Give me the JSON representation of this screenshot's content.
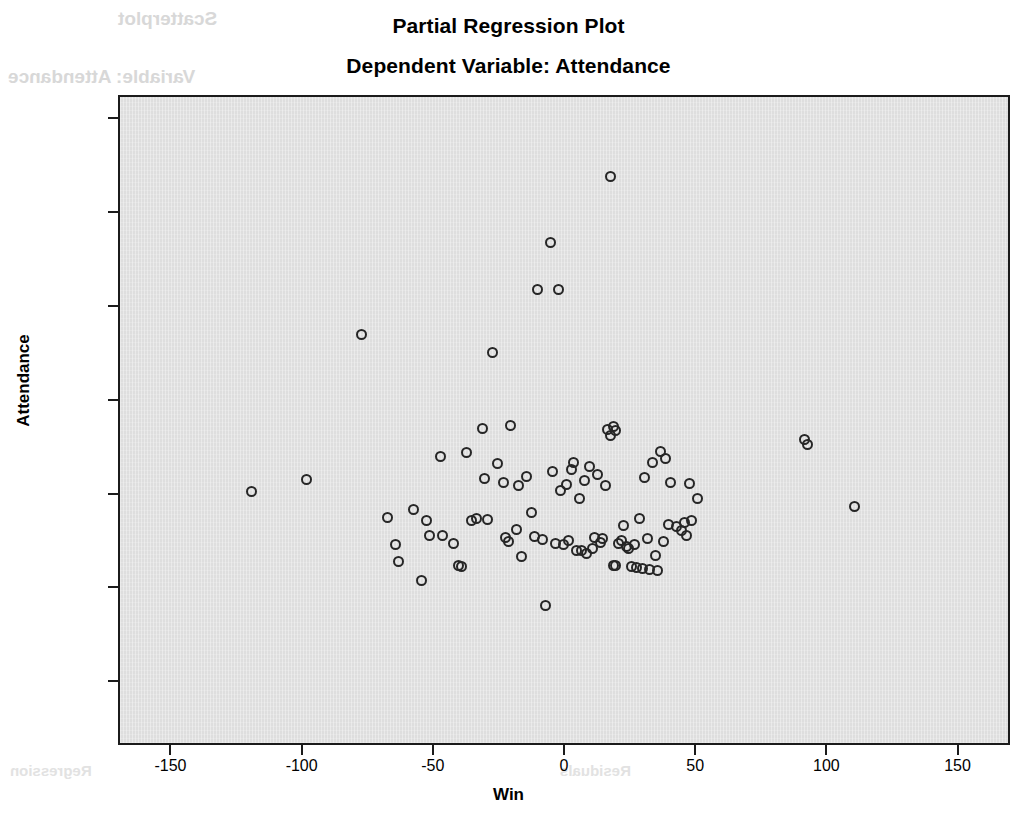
{
  "chart_data": {
    "type": "scatter",
    "title": "Partial Regression Plot",
    "subtitle": "Dependent Variable: Attendance",
    "xlabel": "Win",
    "ylabel": "Attendance",
    "xlim": [
      -170,
      170
    ],
    "ylim": [
      -26800,
      42500
    ],
    "xticks": [
      -150,
      -100,
      -50,
      0,
      50,
      100,
      150
    ],
    "xtick_labels": [
      "-150",
      "-100",
      "-50",
      "0",
      "50",
      "100",
      "150"
    ],
    "yticks": [
      40000,
      30000,
      20000,
      10000,
      0,
      -10000,
      -20000
    ],
    "ytick_labels": [
      "40000",
      "30000",
      "20000",
      "10000",
      "0",
      "-10000",
      "-20000"
    ],
    "grid": false,
    "legend": false,
    "marker": "open-circle",
    "marker_color": "#262626",
    "plot_background": "#dedede",
    "n_points": 95,
    "points": [
      [
        -120,
        400
      ],
      [
        -99,
        1700
      ],
      [
        -78,
        17200
      ],
      [
        -68,
        -2300
      ],
      [
        -65,
        -5200
      ],
      [
        -64,
        -7000
      ],
      [
        -58,
        -1500
      ],
      [
        -55,
        -9000
      ],
      [
        -53,
        -2600
      ],
      [
        -52,
        -4300
      ],
      [
        -48,
        4200
      ],
      [
        -47,
        -4200
      ],
      [
        -43,
        -5100
      ],
      [
        -41,
        -7400
      ],
      [
        -40,
        -7600
      ],
      [
        -38,
        4600
      ],
      [
        -36,
        -2600
      ],
      [
        -34,
        -2400
      ],
      [
        -32,
        7200
      ],
      [
        -31,
        1800
      ],
      [
        -30,
        -2500
      ],
      [
        -28,
        15300
      ],
      [
        -26,
        3400
      ],
      [
        -24,
        1400
      ],
      [
        -23,
        -4500
      ],
      [
        -22,
        -4900
      ],
      [
        -21,
        7500
      ],
      [
        -19,
        -3600
      ],
      [
        -18,
        1100
      ],
      [
        -17,
        -6500
      ],
      [
        -15,
        2000
      ],
      [
        -13,
        -1800
      ],
      [
        -12,
        -4400
      ],
      [
        -11,
        22000
      ],
      [
        -9,
        -4700
      ],
      [
        -8,
        -11700
      ],
      [
        -6,
        27000
      ],
      [
        -5,
        2600
      ],
      [
        -4,
        -5100
      ],
      [
        -3,
        22000
      ],
      [
        -2,
        600
      ],
      [
        -1,
        -5200
      ],
      [
        0,
        1200
      ],
      [
        1,
        -4800
      ],
      [
        2,
        2800
      ],
      [
        3,
        3500
      ],
      [
        4,
        -5900
      ],
      [
        5,
        -300
      ],
      [
        6,
        -5800
      ],
      [
        7,
        1600
      ],
      [
        8,
        -6200
      ],
      [
        9,
        3100
      ],
      [
        10,
        -5600
      ],
      [
        11,
        -4500
      ],
      [
        12,
        2200
      ],
      [
        13,
        -5000
      ],
      [
        14,
        -4600
      ],
      [
        15,
        1100
      ],
      [
        16,
        7100
      ],
      [
        17,
        34000
      ],
      [
        17,
        6400
      ],
      [
        18,
        7400
      ],
      [
        18,
        -7400
      ],
      [
        19,
        -7500
      ],
      [
        19,
        6900
      ],
      [
        20,
        -5100
      ],
      [
        21,
        -4800
      ],
      [
        22,
        -3200
      ],
      [
        23,
        -5400
      ],
      [
        24,
        -5600
      ],
      [
        25,
        -7600
      ],
      [
        26,
        -5200
      ],
      [
        27,
        -7700
      ],
      [
        28,
        -2400
      ],
      [
        29,
        -7800
      ],
      [
        30,
        1900
      ],
      [
        31,
        -4600
      ],
      [
        32,
        -7900
      ],
      [
        33,
        3500
      ],
      [
        34,
        -6400
      ],
      [
        35,
        -8000
      ],
      [
        36,
        4700
      ],
      [
        37,
        -4900
      ],
      [
        38,
        4000
      ],
      [
        39,
        -3100
      ],
      [
        40,
        1400
      ],
      [
        42,
        -3300
      ],
      [
        44,
        -3700
      ],
      [
        45,
        -2900
      ],
      [
        46,
        -4300
      ],
      [
        47,
        1300
      ],
      [
        48,
        -2600
      ],
      [
        50,
        -300
      ],
      [
        91,
        6000
      ],
      [
        92,
        5500
      ],
      [
        110,
        -1200
      ]
    ]
  },
  "artifacts": {
    "bleed_top_1": "Scatterplot",
    "bleed_top_2": "Variable: Attendance",
    "bleed_bottom_1": "Regression",
    "bleed_bottom_2": "Residuals"
  }
}
